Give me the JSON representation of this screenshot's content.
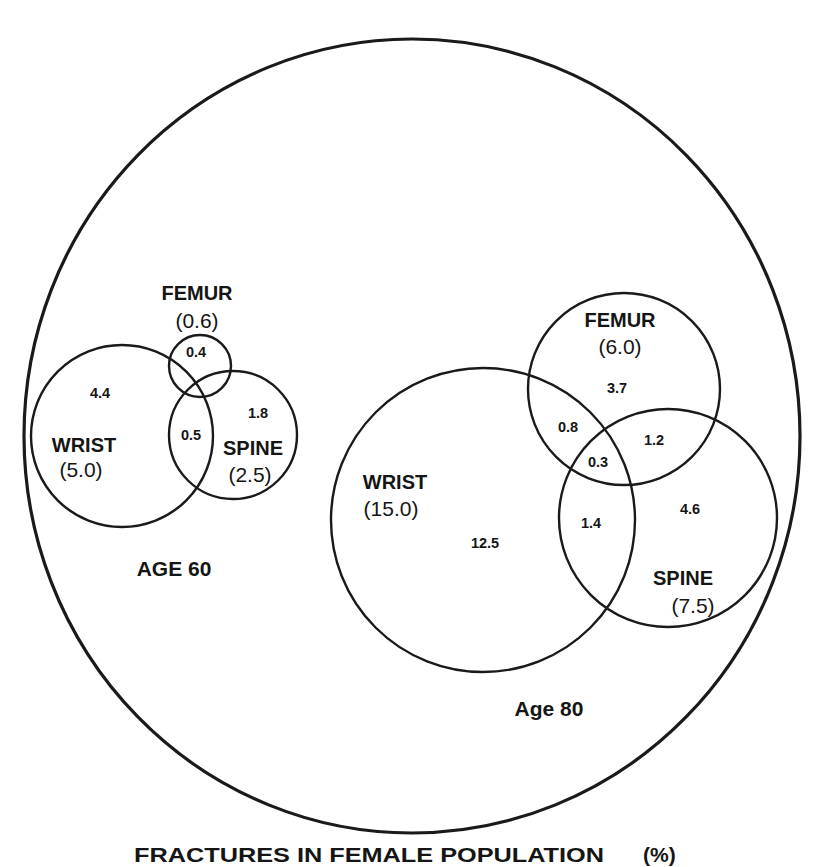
{
  "figure": {
    "caption": {
      "main": "FRACTURES IN FEMALE POPULATION",
      "unit": "(%)"
    },
    "groups": [
      {
        "age_label": "AGE 60",
        "sets": {
          "wrist": {
            "name": "WRIST",
            "total": "(5.0)",
            "only": "4.4"
          },
          "femur": {
            "name": "FEMUR",
            "total": "(0.6)",
            "only": "0.4"
          },
          "spine": {
            "name": "SPINE",
            "total": "(2.5)",
            "only": "1.8"
          }
        },
        "overlaps": {
          "wrist_spine": "0.5"
        }
      },
      {
        "age_label": "Age 80",
        "sets": {
          "wrist": {
            "name": "WRIST",
            "total": "(15.0)",
            "only": "12.5"
          },
          "femur": {
            "name": "FEMUR",
            "total": "(6.0)",
            "only": "3.7"
          },
          "spine": {
            "name": "SPINE",
            "total": "(7.5)",
            "only": "4.6"
          }
        },
        "overlaps": {
          "wrist_femur": "0.8",
          "femur_spine": "1.2",
          "wrist_femur_spine": "0.3",
          "wrist_spine": "1.4"
        }
      }
    ],
    "colors": {
      "stroke": "#1a1a1a",
      "text": "#151515",
      "background": "#ffffff"
    }
  }
}
